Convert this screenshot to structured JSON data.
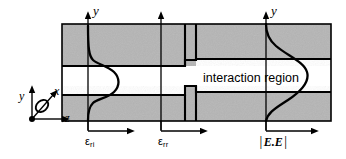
{
  "figure": {
    "background_color": "#ffffff",
    "line_color": "#000000",
    "cladding_color": "#b5b5b5",
    "core_color": "#ffffff"
  },
  "coordinate_inset": {
    "name": "coordinate-axes-inset",
    "y_label": "y",
    "x_label": "x",
    "z_label": "z",
    "x_out_of_plane_symbol": "circle-arrow"
  },
  "structure": {
    "upper_cladding_label": "",
    "lower_cladding_label": "",
    "core_label": "",
    "interaction_region_label": "interaction region"
  },
  "stations": [
    {
      "id": "station-1",
      "axis_label": "y",
      "quantity_label": "ε",
      "quantity_subscript": "ri",
      "direction_label": "",
      "profile": "narrow",
      "x": 88
    },
    {
      "id": "station-2",
      "axis_label": "",
      "quantity_label": "ε",
      "quantity_subscript": "rr",
      "direction_label": "",
      "profile": "none",
      "x": 161
    },
    {
      "id": "station-3",
      "axis_label": "y",
      "quantity_label": "E.E",
      "quantity_subscript": "",
      "quantity_left_bar": "|",
      "quantity_right_bar": "|",
      "direction_label": "",
      "profile": "broad",
      "x": 266
    }
  ],
  "labels": {
    "eps_ri_base": "ε",
    "eps_ri_sub": "ri",
    "eps_rr_base": "ε",
    "eps_rr_sub": "rr",
    "ee_base": "E.E",
    "ee_bar_left": "|",
    "ee_bar_right": "|",
    "axis_y_left": "y",
    "axis_y_right": "y",
    "inset_y": "y",
    "inset_x": "x",
    "inset_z": "z",
    "interaction_region": "interaction region"
  }
}
